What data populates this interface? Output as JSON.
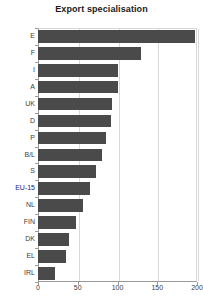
{
  "chart_data": {
    "type": "bar",
    "orientation": "horizontal",
    "title": "Export specialisation",
    "xlabel": "",
    "ylabel": "",
    "categories": [
      "E",
      "F",
      "I",
      "A",
      "UK",
      "D",
      "P",
      "B/L",
      "S",
      "EU-15",
      "NL",
      "FIN",
      "DK",
      "EL",
      "IRL"
    ],
    "values": [
      197,
      130,
      100,
      100,
      93,
      92,
      85,
      80,
      73,
      66,
      56,
      48,
      39,
      35,
      21
    ],
    "xlim": [
      0,
      200
    ],
    "xticks": [
      0,
      50,
      100,
      150,
      200
    ],
    "xtick_labels": [
      "0",
      "50",
      "100",
      "150",
      "200"
    ],
    "grid": "vertical",
    "legend": "none",
    "bar_color": "#4a4a4a",
    "highlight_category": "EU-15",
    "highlight_label_color": "#20208c"
  }
}
